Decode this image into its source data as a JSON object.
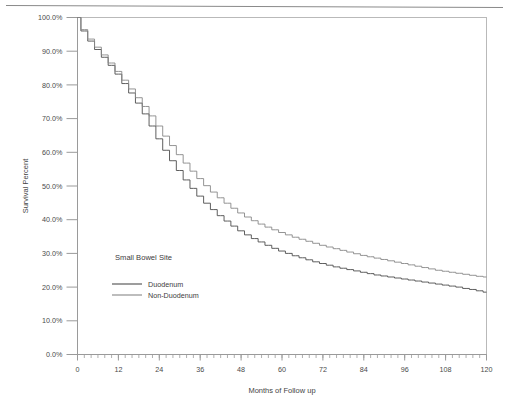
{
  "figure": {
    "has_top_rule": true,
    "background_color": "#ffffff"
  },
  "chart_data": {
    "type": "line",
    "title": "",
    "subtitle": "",
    "xlabel": "Months of Follow up",
    "ylabel": "Survival Percent",
    "xlim": [
      0,
      120
    ],
    "ylim": [
      0,
      100
    ],
    "grid": false,
    "legend_position": "inside-lower-left",
    "legend_title": "Small Bowel Site",
    "x_tick_labels": [
      "0",
      "12",
      "24",
      "36",
      "48",
      "60",
      "72",
      "84",
      "96",
      "108",
      "120"
    ],
    "x_tick_values": [
      0,
      12,
      24,
      36,
      48,
      60,
      72,
      84,
      96,
      108,
      120
    ],
    "x_minor_tick_interval": 2,
    "y_tick_labels": [
      "0.0%",
      "10.0%",
      "20.0%",
      "30.0%",
      "40.0%",
      "50.0%",
      "60.0%",
      "70.0%",
      "80.0%",
      "90.0%",
      "100.0%"
    ],
    "y_tick_values": [
      0,
      10,
      20,
      30,
      40,
      50,
      60,
      70,
      80,
      90,
      100
    ],
    "axis_color": "#9a9a9a",
    "x": [
      0,
      2,
      4,
      6,
      8,
      10,
      12,
      14,
      16,
      18,
      20,
      22,
      24,
      26,
      28,
      30,
      32,
      34,
      36,
      38,
      40,
      42,
      44,
      46,
      48,
      50,
      52,
      54,
      56,
      58,
      60,
      62,
      64,
      66,
      68,
      70,
      72,
      74,
      76,
      78,
      80,
      82,
      84,
      86,
      88,
      90,
      92,
      94,
      96,
      98,
      100,
      102,
      104,
      106,
      108,
      110,
      112,
      114,
      116,
      118,
      120
    ],
    "series": [
      {
        "name": "Duodenum",
        "color": "#4d4d4d",
        "values": [
          100.0,
          96.0,
          93.0,
          90.5,
          88.2,
          85.8,
          83.2,
          80.4,
          77.6,
          74.6,
          71.4,
          67.8,
          64.0,
          60.6,
          57.5,
          54.6,
          51.8,
          49.3,
          47.0,
          44.9,
          43.0,
          41.2,
          39.6,
          38.1,
          36.7,
          35.5,
          34.4,
          33.4,
          32.4,
          31.5,
          30.7,
          30.0,
          29.3,
          28.7,
          28.1,
          27.5,
          27.0,
          26.5,
          26.0,
          25.6,
          25.2,
          24.8,
          24.4,
          24.0,
          23.6,
          23.3,
          23.0,
          22.7,
          22.4,
          22.1,
          21.8,
          21.5,
          21.2,
          20.9,
          20.6,
          20.3,
          20.0,
          19.6,
          19.3,
          18.9,
          18.5
        ]
      },
      {
        "name": "Non-Duodenum",
        "color": "#888888",
        "values": [
          100.0,
          96.4,
          93.6,
          91.2,
          88.9,
          86.5,
          84.0,
          81.4,
          78.8,
          76.2,
          73.6,
          70.8,
          67.8,
          64.8,
          62.0,
          59.3,
          56.8,
          54.4,
          52.2,
          50.1,
          48.2,
          46.5,
          44.9,
          43.4,
          42.0,
          40.8,
          39.7,
          38.7,
          37.8,
          37.0,
          36.2,
          35.5,
          34.8,
          34.2,
          33.6,
          33.0,
          32.4,
          31.9,
          31.4,
          30.9,
          30.4,
          29.9,
          29.4,
          29.0,
          28.6,
          28.2,
          27.8,
          27.4,
          27.0,
          26.6,
          26.2,
          25.8,
          25.4,
          25.0,
          24.7,
          24.4,
          24.1,
          23.8,
          23.5,
          23.2,
          23.0
        ]
      }
    ]
  }
}
